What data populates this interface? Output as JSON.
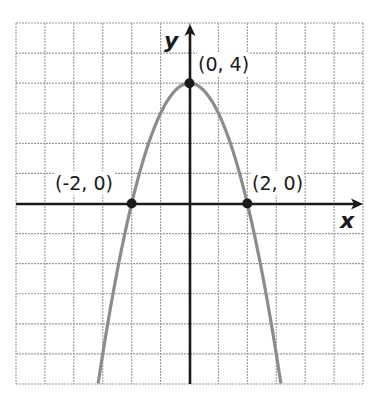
{
  "chart_data": {
    "type": "line",
    "title": "",
    "function": "y = -x^2 + 4",
    "xlabel": "x",
    "ylabel": "y",
    "xlim": [
      -6,
      6
    ],
    "ylim": [
      -6,
      6
    ],
    "grid": true,
    "grid_step": 1,
    "legend": null,
    "series": [
      {
        "name": "parabola",
        "color": "#8c8c8c",
        "x": [
          -3.16,
          -3,
          -2.5,
          -2,
          -1.5,
          -1,
          -0.5,
          0,
          0.5,
          1,
          1.5,
          2,
          2.5,
          3,
          3.16
        ],
        "y": [
          -6,
          -5,
          -2.25,
          0,
          1.75,
          3,
          3.75,
          4,
          3.75,
          3,
          1.75,
          0,
          -2.25,
          -5,
          -6
        ]
      }
    ],
    "points": [
      {
        "x": 0,
        "y": 4,
        "label": "(0, 4)"
      },
      {
        "x": -2,
        "y": 0,
        "label": "(-2, 0)"
      },
      {
        "x": 2,
        "y": 0,
        "label": "(2, 0)"
      }
    ]
  },
  "labels": {
    "x_axis": "x",
    "y_axis": "y",
    "vertex": "(0, 4)",
    "left_intercept": "(-2, 0)",
    "right_intercept": "(2, 0)"
  },
  "colors": {
    "grid": "#9a9a9a",
    "axis": "#1a1a1a",
    "curve": "#8c8c8c",
    "point": "#1a1a1a"
  }
}
